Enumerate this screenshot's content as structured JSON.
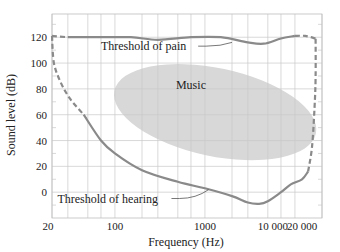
{
  "chart_data": {
    "type": "line",
    "title": "",
    "xlabel": "Frequency (Hz)",
    "ylabel": "Sound level (dB)",
    "x_scale": "log",
    "xlim": [
      20,
      20000
    ],
    "ylim": [
      -20,
      138
    ],
    "x_ticks": [
      {
        "value": 20,
        "label": "20"
      },
      {
        "value": 100,
        "label": "100"
      },
      {
        "value": 1000,
        "label": "1000"
      },
      {
        "value": 10000,
        "label": "10 000"
      },
      {
        "value": 20000,
        "label": "20 000"
      }
    ],
    "y_ticks": [
      {
        "value": 0,
        "label": "0"
      },
      {
        "value": 20,
        "label": "20"
      },
      {
        "value": 40,
        "label": "40"
      },
      {
        "value": 60,
        "label": "60"
      },
      {
        "value": 80,
        "label": "80"
      },
      {
        "value": 100,
        "label": "100"
      },
      {
        "value": 120,
        "label": "120"
      }
    ],
    "grid": true,
    "x_grid": [
      20,
      30,
      50,
      70,
      100,
      200,
      300,
      500,
      700,
      1000,
      2000,
      3000,
      5000,
      7000,
      10000,
      20000
    ],
    "y_grid": [
      -10,
      0,
      10,
      20,
      30,
      40,
      50,
      60,
      70,
      80,
      90,
      100,
      110,
      120,
      130
    ],
    "series": [
      {
        "name": "Threshold of pain",
        "style": "solid",
        "points": [
          [
            30,
            120
          ],
          [
            60,
            120
          ],
          [
            150,
            120
          ],
          [
            300,
            118
          ],
          [
            700,
            120
          ],
          [
            1500,
            120
          ],
          [
            3000,
            116
          ],
          [
            4500,
            115
          ],
          [
            7000,
            119
          ],
          [
            10000,
            121
          ]
        ]
      },
      {
        "name": "Threshold of pain (extrapolated)",
        "style": "dashed",
        "points": [
          [
            20,
            121
          ],
          [
            30,
            120
          ]
        ]
      },
      {
        "name": "Threshold of pain (extrapolated high)",
        "style": "dashed",
        "points": [
          [
            10000,
            121
          ],
          [
            13000,
            121
          ],
          [
            17000,
            119
          ]
        ]
      },
      {
        "name": "Threshold of hearing",
        "style": "solid",
        "points": [
          [
            45,
            60
          ],
          [
            70,
            40
          ],
          [
            100,
            30
          ],
          [
            200,
            17
          ],
          [
            500,
            8
          ],
          [
            1000,
            3
          ],
          [
            2000,
            -3
          ],
          [
            3000,
            -8
          ],
          [
            4000,
            -9
          ],
          [
            5000,
            -7
          ],
          [
            7000,
            0
          ],
          [
            9000,
            6
          ],
          [
            12000,
            10
          ],
          [
            14000,
            16
          ]
        ]
      },
      {
        "name": "Threshold of hearing (extrapolated low)",
        "style": "dashed",
        "points": [
          [
            20,
            121
          ],
          [
            21,
            100
          ],
          [
            25,
            85
          ],
          [
            32,
            72
          ],
          [
            45,
            60
          ]
        ]
      },
      {
        "name": "Threshold of hearing (extrapolated high)",
        "style": "dashed",
        "points": [
          [
            14000,
            16
          ],
          [
            15500,
            35
          ],
          [
            16500,
            65
          ],
          [
            17000,
            90
          ],
          [
            17000,
            119
          ]
        ]
      }
    ],
    "regions": [
      {
        "name": "Music",
        "type": "ellipse",
        "cx_hz": 1300,
        "cy_db": 62,
        "rx_px": 103,
        "ry_px": 44,
        "rotate_deg": 12,
        "color": "#d8d8d8"
      }
    ],
    "annotations": [
      {
        "text": "Threshold of pain",
        "x_hz": 70,
        "y_db": 110,
        "leader_to": [
          2000,
          116
        ]
      },
      {
        "text": "Music",
        "x_hz": 700,
        "y_db": 80
      },
      {
        "text": "Threshold of hearing",
        "x_hz": 23,
        "y_db": -8,
        "leader_to": [
          1100,
          2
        ]
      }
    ],
    "colors": {
      "curve": "#8a8a8a",
      "grid": "#c8c8c8",
      "frame": "#bdbdbd",
      "music": "#d6d6d6",
      "text": "#222222"
    }
  }
}
